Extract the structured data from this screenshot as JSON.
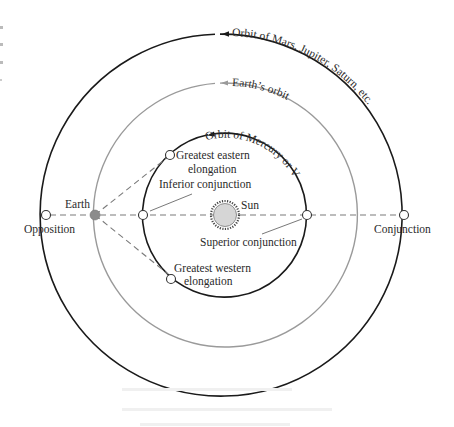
{
  "diagram": {
    "type": "planetary-configurations",
    "center": {
      "x": 225,
      "y": 215
    },
    "colors": {
      "outer_orbit": "#1a1a1a",
      "earth_orbit": "#9a9a9a",
      "inner_orbit": "#1a1a1a",
      "dashed_lines": "#7a7a7a",
      "earth_fill": "#8c8c8c",
      "sun_fill": "#d6d6d6",
      "text": "#2a2a2a"
    },
    "orbits": {
      "outer": {
        "label": "Orbit of Mars, Jupiter, Saturn, etc.",
        "radius": 181
      },
      "earth": {
        "label": "Earth’s orbit",
        "radius": 132
      },
      "inner": {
        "label": "Orbit of Mercury or Venus",
        "radius": 82
      }
    },
    "bodies": {
      "sun": {
        "label": "Sun"
      },
      "earth": {
        "label": "Earth"
      }
    },
    "positions": {
      "opposition": {
        "label": "Opposition"
      },
      "conjunction": {
        "label": "Conjunction"
      },
      "inferior_conjunction": {
        "label": "Inferior conjunction"
      },
      "superior_conjunction": {
        "label": "Superior conjunction"
      },
      "greatest_eastern_elongation": {
        "label_line1": "Greatest eastern",
        "label_line2": "elongation"
      },
      "greatest_western_elongation": {
        "label_line1": "Greatest western",
        "label_line2": "elongation"
      }
    }
  }
}
